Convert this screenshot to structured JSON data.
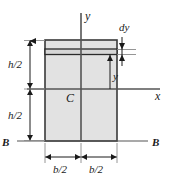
{
  "figure": {
    "shape": {
      "name": "rectangle-cross-section",
      "fill_color": "#e2e2e2",
      "stroke_color": "#3a3a3a",
      "left": 45,
      "right": 117,
      "top": 40,
      "bottom": 141,
      "width_px": 72,
      "height_px": 101
    },
    "strip": {
      "name": "differential-strip",
      "top": 49,
      "bottom": 54,
      "fill_color": "#d8d8d8"
    },
    "axes": {
      "x_axis": {
        "label": "x",
        "y": 89,
        "x_start": 27,
        "x_end": 160
      },
      "y_axis": {
        "label": "y",
        "x": 81,
        "y_start": 13,
        "y_end": 141
      },
      "centroid": {
        "label": "C",
        "x": 72,
        "y": 98
      }
    },
    "labels": {
      "y_axis_label": "y",
      "x_axis_label": "x",
      "centroid_label": "C",
      "dy_label": "dy",
      "y_distance_label": "y",
      "h_half_upper_label": "h/2",
      "h_half_lower_label": "h/2",
      "b_half_left_label": "b/2",
      "b_half_right_label": "b/2",
      "section_left_label": "B",
      "section_right_label": "B"
    },
    "dimensions": [
      {
        "name": "h-half-upper",
        "text": "h/2",
        "orientation": "vertical",
        "from": 40,
        "to": 89,
        "at": 30
      },
      {
        "name": "h-half-lower",
        "text": "h/2",
        "orientation": "vertical",
        "from": 89,
        "to": 141,
        "at": 30
      },
      {
        "name": "b-half-left",
        "text": "b/2",
        "orientation": "horizontal",
        "from": 45,
        "to": 81,
        "at": 157
      },
      {
        "name": "b-half-right",
        "text": "b/2",
        "orientation": "horizontal",
        "from": 81,
        "to": 117,
        "at": 157
      },
      {
        "name": "dy-thickness",
        "text": "dy",
        "orientation": "vertical",
        "from": 49,
        "to": 54,
        "at": 122
      },
      {
        "name": "y-distance",
        "text": "y",
        "orientation": "vertical",
        "from": 54,
        "to": 89,
        "at": 110
      }
    ],
    "section_line": {
      "name": "section-line-b-b",
      "y": 141,
      "left_label": "B",
      "right_label": "B"
    },
    "colors": {
      "line": "#1a1a1a",
      "outline": "#3a3a3a",
      "fill": "#e2e2e2",
      "background": "#ffffff"
    }
  }
}
